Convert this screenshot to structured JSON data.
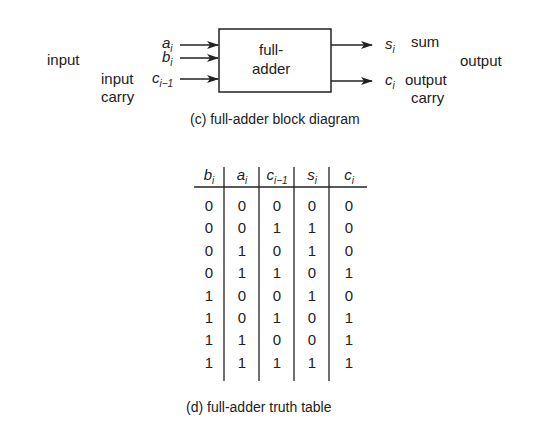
{
  "block_diagram": {
    "box_label_line1": "full-",
    "box_label_line2": "adder",
    "left_group_label": "input",
    "input_carry_line1": "input",
    "input_carry_line2": "carry",
    "inputs": [
      {
        "var": "a",
        "sub": "i"
      },
      {
        "var": "b",
        "sub": "i"
      },
      {
        "var": "c",
        "sub": "i−1"
      }
    ],
    "outputs": [
      {
        "var": "s",
        "sub": "i",
        "desc": "sum"
      },
      {
        "var": "c",
        "sub": "i",
        "desc": "output",
        "desc2": "carry"
      }
    ],
    "right_group_label": "output",
    "caption": "(c) full-adder block diagram"
  },
  "truth_table": {
    "headers": [
      {
        "var": "b",
        "sub": "i"
      },
      {
        "var": "a",
        "sub": "i"
      },
      {
        "var": "c",
        "sub": "i−1"
      },
      {
        "var": "s",
        "sub": "i"
      },
      {
        "var": "c",
        "sub": "i"
      }
    ],
    "rows": [
      [
        "0",
        "0",
        "0",
        "0",
        "0"
      ],
      [
        "0",
        "0",
        "1",
        "1",
        "0"
      ],
      [
        "0",
        "1",
        "0",
        "1",
        "0"
      ],
      [
        "0",
        "1",
        "1",
        "0",
        "1"
      ],
      [
        "1",
        "0",
        "0",
        "1",
        "0"
      ],
      [
        "1",
        "0",
        "1",
        "0",
        "1"
      ],
      [
        "1",
        "1",
        "0",
        "0",
        "1"
      ],
      [
        "1",
        "1",
        "1",
        "1",
        "1"
      ]
    ],
    "caption": "(d) full-adder truth table"
  }
}
